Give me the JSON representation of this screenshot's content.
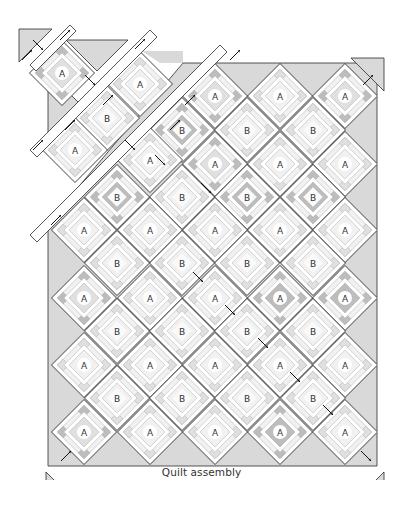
{
  "caption": "Quilt assembly",
  "colors": {
    "background": "#ffffff",
    "setting_triangle": "#d9d9d9",
    "outline": "#2b2b2b",
    "light": "#f1f1f1",
    "mid": "#e0e0e0",
    "dark": "#bdbdbd",
    "darker": "#a9a9a9",
    "center_circle": "#ffffff",
    "label": "#333333"
  },
  "grid": {
    "half_diagonal": 32.5,
    "spacing": 65,
    "quilt_left": 48,
    "quilt_right": 377,
    "quilt_top": 63,
    "quilt_bottom": 466
  },
  "blocks": [
    {
      "label": "A",
      "x": 215,
      "y": 96,
      "tone": "mid"
    },
    {
      "label": "A",
      "x": 280,
      "y": 96,
      "tone": "light"
    },
    {
      "label": "A",
      "x": 345,
      "y": 96,
      "tone": "mid"
    },
    {
      "label": "B",
      "x": 182,
      "y": 130,
      "tone": "dark"
    },
    {
      "label": "B",
      "x": 247,
      "y": 130,
      "tone": "light"
    },
    {
      "label": "B",
      "x": 313,
      "y": 130,
      "tone": "light"
    },
    {
      "label": "A",
      "x": 215,
      "y": 164,
      "tone": "mid"
    },
    {
      "label": "A",
      "x": 280,
      "y": 164,
      "tone": "light"
    },
    {
      "label": "A",
      "x": 345,
      "y": 164,
      "tone": "light"
    },
    {
      "label": "B",
      "x": 117,
      "y": 197,
      "tone": "dark"
    },
    {
      "label": "B",
      "x": 182,
      "y": 197,
      "tone": "light"
    },
    {
      "label": "B",
      "x": 247,
      "y": 197,
      "tone": "dark"
    },
    {
      "label": "B",
      "x": 313,
      "y": 197,
      "tone": "dark"
    },
    {
      "label": "A",
      "x": 84,
      "y": 230,
      "tone": "light"
    },
    {
      "label": "A",
      "x": 150,
      "y": 230,
      "tone": "light"
    },
    {
      "label": "A",
      "x": 215,
      "y": 230,
      "tone": "light"
    },
    {
      "label": "A",
      "x": 280,
      "y": 230,
      "tone": "light"
    },
    {
      "label": "A",
      "x": 345,
      "y": 230,
      "tone": "light"
    },
    {
      "label": "B",
      "x": 117,
      "y": 263,
      "tone": "light"
    },
    {
      "label": "B",
      "x": 182,
      "y": 263,
      "tone": "light"
    },
    {
      "label": "B",
      "x": 247,
      "y": 263,
      "tone": "light"
    },
    {
      "label": "B",
      "x": 313,
      "y": 263,
      "tone": "light"
    },
    {
      "label": "A",
      "x": 84,
      "y": 298,
      "tone": "mid"
    },
    {
      "label": "A",
      "x": 150,
      "y": 298,
      "tone": "light"
    },
    {
      "label": "A",
      "x": 215,
      "y": 298,
      "tone": "light"
    },
    {
      "label": "A",
      "x": 280,
      "y": 298,
      "tone": "dark"
    },
    {
      "label": "A",
      "x": 345,
      "y": 298,
      "tone": "dark"
    },
    {
      "label": "B",
      "x": 117,
      "y": 331,
      "tone": "light"
    },
    {
      "label": "B",
      "x": 182,
      "y": 331,
      "tone": "light"
    },
    {
      "label": "B",
      "x": 247,
      "y": 331,
      "tone": "light"
    },
    {
      "label": "B",
      "x": 313,
      "y": 331,
      "tone": "light"
    },
    {
      "label": "A",
      "x": 84,
      "y": 365,
      "tone": "light"
    },
    {
      "label": "A",
      "x": 150,
      "y": 365,
      "tone": "light"
    },
    {
      "label": "A",
      "x": 215,
      "y": 365,
      "tone": "light"
    },
    {
      "label": "A",
      "x": 280,
      "y": 365,
      "tone": "light"
    },
    {
      "label": "A",
      "x": 345,
      "y": 365,
      "tone": "light"
    },
    {
      "label": "B",
      "x": 117,
      "y": 398,
      "tone": "light"
    },
    {
      "label": "B",
      "x": 182,
      "y": 398,
      "tone": "light"
    },
    {
      "label": "B",
      "x": 247,
      "y": 398,
      "tone": "light"
    },
    {
      "label": "B",
      "x": 313,
      "y": 398,
      "tone": "light"
    },
    {
      "label": "A",
      "x": 84,
      "y": 432,
      "tone": "mid"
    },
    {
      "label": "A",
      "x": 150,
      "y": 432,
      "tone": "light"
    },
    {
      "label": "A",
      "x": 215,
      "y": 432,
      "tone": "light"
    },
    {
      "label": "A",
      "x": 280,
      "y": 432,
      "tone": "dark"
    },
    {
      "label": "A",
      "x": 345,
      "y": 432,
      "tone": "light"
    }
  ],
  "offset_blocks": [
    {
      "label": "A",
      "x": 62,
      "y": 73,
      "tone": "mid"
    },
    {
      "label": "A",
      "x": 140,
      "y": 84,
      "tone": "light"
    },
    {
      "label": "B",
      "x": 107,
      "y": 118,
      "tone": "light"
    },
    {
      "label": "A",
      "x": 75,
      "y": 150,
      "tone": "light"
    },
    {
      "label": "A",
      "x": 150,
      "y": 160,
      "tone": "light"
    }
  ],
  "corner_triangles": [
    {
      "name": "top-left",
      "points": "19,29 52,29 19,62"
    },
    {
      "name": "top-right",
      "points": "351,58 384,58 384,91"
    },
    {
      "name": "bottom-left",
      "points": "46,472 46,505 79,505"
    },
    {
      "name": "bottom-right",
      "points": "384,472 384,505 351,505"
    }
  ],
  "arrows": [
    {
      "x": 38,
      "y": 45,
      "dir": "nwse"
    },
    {
      "x": 65,
      "y": 35,
      "dir": "swne"
    },
    {
      "x": 27,
      "y": 55,
      "dir": "swne"
    },
    {
      "x": 90,
      "y": 80,
      "dir": "nwse"
    },
    {
      "x": 140,
      "y": 44,
      "dir": "swne"
    },
    {
      "x": 108,
      "y": 100,
      "dir": "swne"
    },
    {
      "x": 70,
      "y": 125,
      "dir": "swne"
    },
    {
      "x": 38,
      "y": 145,
      "dir": "swne"
    },
    {
      "x": 160,
      "y": 160,
      "dir": "nwse"
    },
    {
      "x": 175,
      "y": 125,
      "dir": "swne"
    },
    {
      "x": 190,
      "y": 100,
      "dir": "swne"
    },
    {
      "x": 235,
      "y": 55,
      "dir": "swne"
    },
    {
      "x": 130,
      "y": 145,
      "dir": "nwse"
    },
    {
      "x": 56,
      "y": 220,
      "dir": "swne"
    },
    {
      "x": 206,
      "y": 188,
      "dir": "nwse"
    },
    {
      "x": 198,
      "y": 277,
      "dir": "nwse"
    },
    {
      "x": 230,
      "y": 310,
      "dir": "nwse"
    },
    {
      "x": 263,
      "y": 343,
      "dir": "nwse"
    },
    {
      "x": 295,
      "y": 377,
      "dir": "nwse"
    },
    {
      "x": 328,
      "y": 410,
      "dir": "nwse"
    },
    {
      "x": 368,
      "y": 80,
      "dir": "swne"
    },
    {
      "x": 66,
      "y": 456,
      "dir": "swne"
    },
    {
      "x": 366,
      "y": 456,
      "dir": "nwse"
    }
  ]
}
